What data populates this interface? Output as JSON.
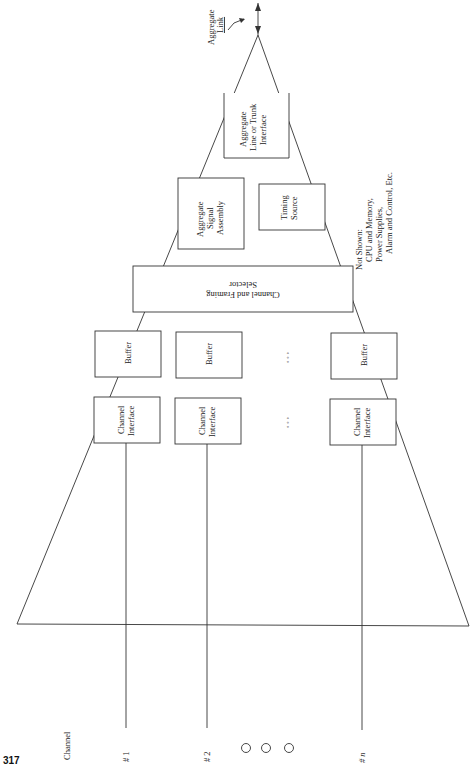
{
  "page": {
    "number": "317"
  },
  "labels": {
    "channel_heading": "Channel",
    "channel_1": "# 1",
    "channel_2": "# 2",
    "channel_n": "# n",
    "aggregate_link_line1": "Aggregate",
    "aggregate_link_line2": "Link"
  },
  "blocks": {
    "aggregate_line_interface": [
      "Aggregate",
      "Line or Trunk",
      "Interface"
    ],
    "aggregate_signal_assembly": [
      "Aggregate",
      "Signal",
      "Assembly"
    ],
    "timing_source": [
      "Timing",
      "Source"
    ],
    "channel_framing_selector": [
      "Channel and Framing",
      "Selector"
    ],
    "buffer": "Buffer",
    "channel_interface": [
      "Channel",
      "Interface"
    ]
  },
  "ellipsis": "◦ ◦ ◦",
  "note": {
    "title": "Not Shown:",
    "lines": [
      "CPU and Memory,",
      "Power Supplies,",
      "Alarm and Control, Etc."
    ]
  }
}
